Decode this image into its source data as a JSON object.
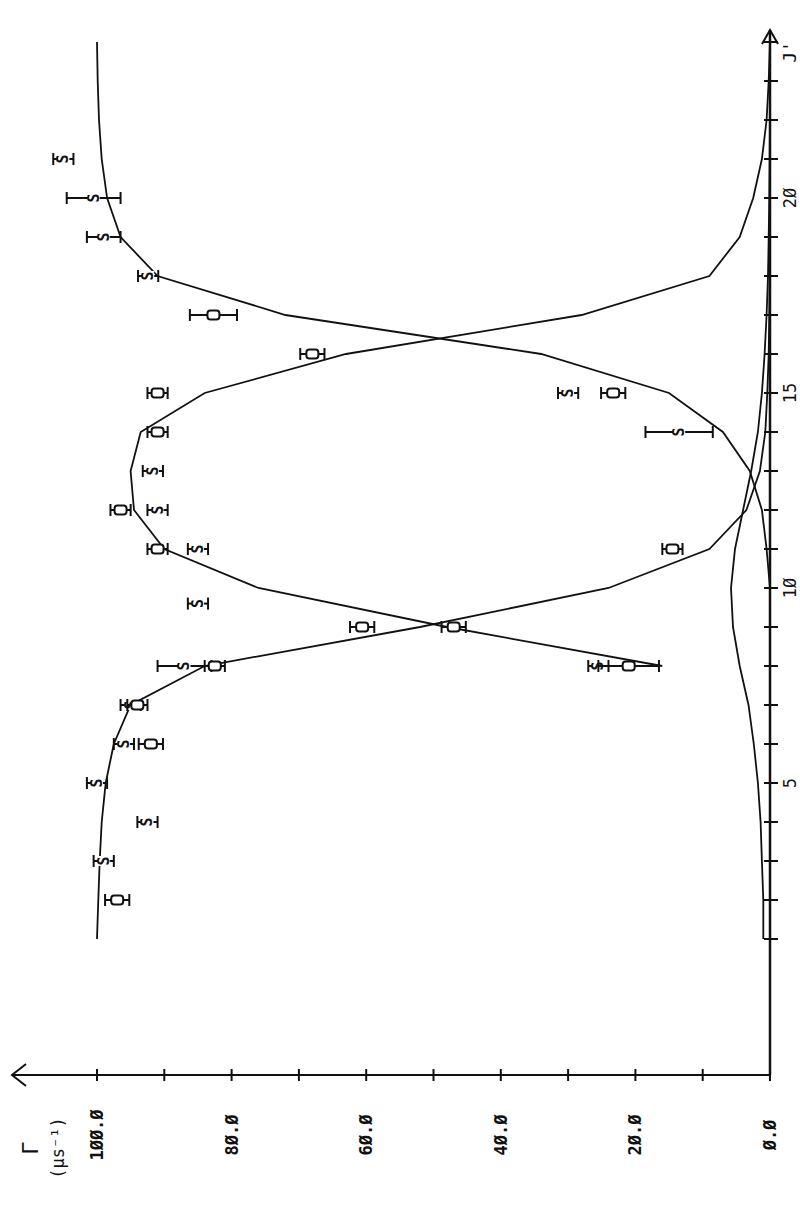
{
  "chart_data": {
    "type": "line",
    "orientation_note": "figure rotated 90 deg counter-clockwise on page",
    "title": "",
    "xlabel": "J'",
    "ylabel": "Γ (μs⁻¹)",
    "xlim": [
      1,
      24
    ],
    "ylim": [
      0,
      100
    ],
    "x_ticks": [
      5,
      10,
      15,
      20
    ],
    "x_tick_labels": [
      "5",
      "1Ø",
      "15",
      "2Ø"
    ],
    "y_ticks": [
      0,
      20,
      40,
      60,
      80,
      100
    ],
    "y_tick_labels": [
      "Ø.Ø",
      "2Ø.Ø",
      "4Ø.Ø",
      "6Ø.Ø",
      "8Ø.Ø",
      "1ØØ.Ø"
    ],
    "grid": false,
    "legend": "none (markers S and O)",
    "series": [
      {
        "name": "curve A (upper, dips at J'≈9–17 crossing)",
        "kind": "line",
        "x": [
          1,
          2,
          3,
          4,
          5,
          6,
          7,
          8,
          9,
          10,
          11,
          12,
          13,
          14,
          15,
          16,
          17,
          18,
          19,
          20,
          21,
          22,
          23,
          24
        ],
        "y": [
          100,
          99.8,
          99.6,
          99.3,
          98.7,
          97.5,
          95,
          84,
          52,
          24,
          9,
          3.5,
          1.5,
          0.7,
          0.4,
          0.2,
          0.1,
          0.05,
          0,
          0,
          0,
          0,
          0,
          0
        ]
      },
      {
        "name": "curve B (bell, high between crossings)",
        "kind": "line",
        "x": [
          8,
          9,
          10,
          11,
          12,
          13,
          14,
          15,
          16,
          17,
          18,
          19,
          20,
          21,
          22,
          23,
          24
        ],
        "y": [
          16,
          48,
          76,
          90,
          94.5,
          95,
          93.5,
          84,
          63,
          28,
          9,
          4.5,
          2.5,
          1.2,
          0.5,
          0.2,
          0
        ]
      },
      {
        "name": "curve C (low, rising at J'≈15–18)",
        "kind": "line",
        "x": [
          1,
          2,
          3,
          4,
          5,
          6,
          7,
          8,
          9,
          10,
          11,
          12,
          13,
          14,
          15,
          16,
          17,
          18,
          19,
          20,
          21,
          22,
          23,
          24
        ],
        "y": [
          0,
          0,
          0,
          0,
          0,
          0,
          0,
          0,
          0,
          0,
          0.5,
          1.2,
          3,
          7,
          15,
          34,
          72,
          91,
          96.5,
          98.5,
          99.3,
          99.7,
          99.9,
          100
        ]
      },
      {
        "name": "curve D (near-zero baseline)",
        "kind": "line",
        "x": [
          1,
          2,
          3,
          4,
          5,
          6,
          7,
          8,
          9,
          10,
          11,
          12,
          13,
          14,
          15,
          16,
          17,
          18,
          19,
          20,
          21,
          22,
          23,
          24
        ],
        "y": [
          1.0,
          1.0,
          1.2,
          1.4,
          1.8,
          2.4,
          3.2,
          4.5,
          5.5,
          5.8,
          5.2,
          4.0,
          2.8,
          1.8,
          1.2,
          0.8,
          0.5,
          0.3,
          0.2,
          0.1,
          0.05,
          0,
          0,
          0
        ]
      },
      {
        "name": "S",
        "kind": "points",
        "marker": "S",
        "points": [
          {
            "x": 3,
            "y": 99,
            "err": 1.5
          },
          {
            "x": 4,
            "y": 92.5,
            "err": 1.5
          },
          {
            "x": 5,
            "y": 100,
            "err": 1.5
          },
          {
            "x": 6,
            "y": 96,
            "err": 1.5
          },
          {
            "x": 7,
            "y": 95,
            "err": 1.5
          },
          {
            "x": 8,
            "y": 87,
            "err": 4
          },
          {
            "x": 8,
            "y": 25.5,
            "err": 1.5
          },
          {
            "x": 9.6,
            "y": 85,
            "err": 1.5
          },
          {
            "x": 11,
            "y": 85,
            "err": 1.5
          },
          {
            "x": 12,
            "y": 91,
            "err": 1.5
          },
          {
            "x": 13,
            "y": 91.7,
            "err": 1.5
          },
          {
            "x": 14,
            "y": 13.5,
            "err": 5
          },
          {
            "x": 15,
            "y": 30,
            "err": 1.5
          },
          {
            "x": 18,
            "y": 92.4,
            "err": 1.5
          },
          {
            "x": 19,
            "y": 99,
            "err": 2.5
          },
          {
            "x": 20,
            "y": 100.5,
            "err": 4
          },
          {
            "x": 21,
            "y": 105,
            "err": 1.5
          }
        ]
      },
      {
        "name": "O",
        "kind": "points",
        "marker": "O",
        "points": [
          {
            "x": 2,
            "y": 97,
            "err": 1.8
          },
          {
            "x": 6,
            "y": 92,
            "err": 1.8
          },
          {
            "x": 7,
            "y": 94,
            "err": 1.5
          },
          {
            "x": 8,
            "y": 82.5,
            "err": 1.5
          },
          {
            "x": 8,
            "y": 21,
            "err": 4.5
          },
          {
            "x": 9,
            "y": 60.6,
            "err": 1.8
          },
          {
            "x": 9,
            "y": 47,
            "err": 1.8
          },
          {
            "x": 11,
            "y": 91,
            "err": 1.5
          },
          {
            "x": 11,
            "y": 14.5,
            "err": 1.5
          },
          {
            "x": 12,
            "y": 96.5,
            "err": 1.5
          },
          {
            "x": 14,
            "y": 91,
            "err": 1.5
          },
          {
            "x": 15,
            "y": 91,
            "err": 1.5
          },
          {
            "x": 15,
            "y": 23.3,
            "err": 1.8
          },
          {
            "x": 16,
            "y": 68,
            "err": 1.8
          },
          {
            "x": 17,
            "y": 82.7,
            "err": 3.5
          }
        ]
      }
    ]
  },
  "axes": {
    "y_axis_symbol": "Γ",
    "y_axis_unit": "(μs⁻¹)",
    "x_axis_symbol": "J'"
  }
}
